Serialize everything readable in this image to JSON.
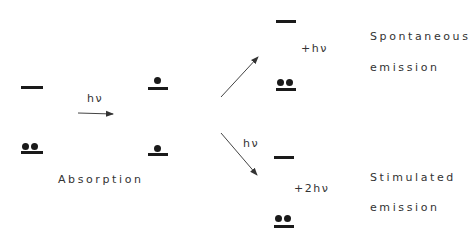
{
  "diagram": {
    "absorption": {
      "photon_label": "hν",
      "caption": "Absorption"
    },
    "spontaneous": {
      "emitted_label": "+hν",
      "caption_line1": "Spontaneous",
      "caption_line2": "emission"
    },
    "stimulated": {
      "incident_label": "hν",
      "emitted_label": "+2hν",
      "caption_line1": "Stimulated",
      "caption_line2": "emission"
    },
    "colors": {
      "ink": "#1a1a1a",
      "text": "#333333",
      "arrow": "#444444"
    }
  }
}
